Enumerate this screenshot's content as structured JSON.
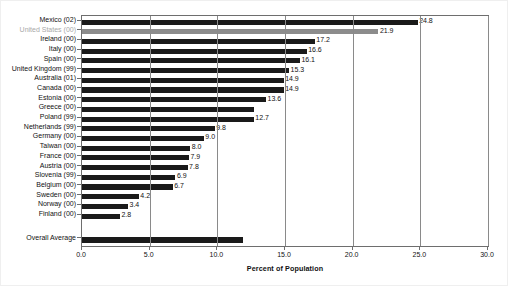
{
  "chart_data": {
    "type": "bar",
    "orientation": "horizontal",
    "title": "",
    "subtitle": "",
    "xlabel": "Percent of Population",
    "ylabel": "",
    "xlim": [
      0.0,
      30.0
    ],
    "xticks": [
      "0.0",
      "5.0",
      "10.0",
      "15.0",
      "20.0",
      "25.0",
      "30.0"
    ],
    "xtick_values": [
      0,
      5,
      10,
      15,
      20,
      25,
      30
    ],
    "grid": "vertical",
    "legend": "none",
    "categories": [
      "Mexico (02)",
      "United States (00)",
      "Ireland (00)",
      "Italy (00)",
      "Spain (00)",
      "United Kingdom (99)",
      "Australia (01)",
      "Canada (00)",
      "Estonia (00)",
      "Greece (00)",
      "Poland (99)",
      "Netherlands (99)",
      "Germany (00)",
      "Taiwan (00)",
      "France (00)",
      "Austria (00)",
      "Slovenia (99)",
      "Belgium (00)",
      "Sweden (00)",
      "Norway (00)",
      "Finland (00)",
      "Overall Average"
    ],
    "values": [
      24.8,
      21.9,
      17.2,
      16.6,
      16.1,
      15.3,
      14.9,
      14.9,
      13.6,
      12.7,
      12.7,
      9.8,
      9.0,
      8.0,
      7.9,
      7.8,
      6.9,
      6.7,
      4.2,
      3.4,
      2.8,
      11.9
    ],
    "data_labels": [
      "24.8",
      "21.9",
      "17.2",
      "16.6",
      "16.1",
      "15.3",
      "14.9",
      "14.9",
      "13.6",
      "",
      "12.7",
      "9.8",
      "9.0",
      "8.0",
      "7.9",
      "7.8",
      "6.9",
      "6.7",
      "4.2",
      "3.4",
      "2.8",
      ""
    ],
    "highlight_category": "United States (00)",
    "colors": {
      "bar": "#1a1a1a",
      "highlight_bar": "#8c8c8c",
      "highlight_label": "#a8a8a8",
      "axis": "#6e6e6e",
      "grid": "#8a8a8a",
      "text": "#111111",
      "background": "#ffffff"
    }
  }
}
